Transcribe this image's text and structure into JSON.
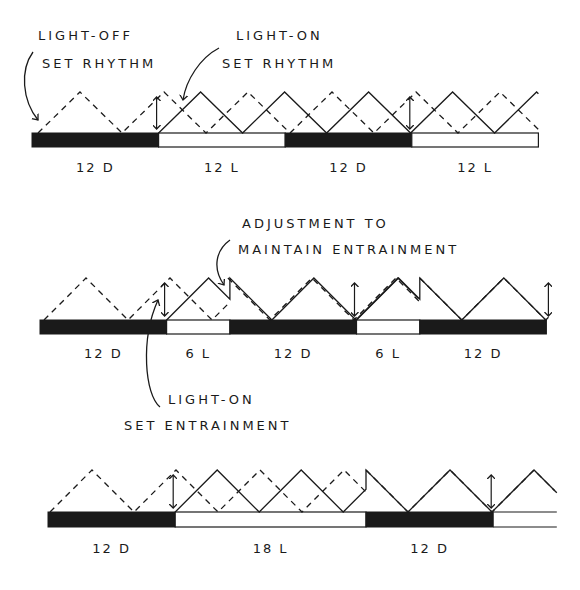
{
  "colors": {
    "ink": "#1a1a1a",
    "dark_phase": "#1a1a1a",
    "light_phase": "#ffffff",
    "background": "#ffffff"
  },
  "panels": [
    {
      "id": "panel-1",
      "schedule": [
        {
          "phase": "D",
          "hours": 12,
          "label": "12 D"
        },
        {
          "phase": "L",
          "hours": 12,
          "label": "12 L"
        },
        {
          "phase": "D",
          "hours": 12,
          "label": "12 D"
        },
        {
          "phase": "L",
          "hours": 12,
          "label": "12 L"
        }
      ],
      "annotations": [
        {
          "lines": [
            "LIGHT-OFF",
            "SET RHYTHM"
          ],
          "target": "free-running dashed rhythm at start of dark"
        },
        {
          "lines": [
            "LIGHT-ON",
            "SET RHYTHM"
          ],
          "target": "solid rhythm starting at light-on"
        }
      ]
    },
    {
      "id": "panel-2",
      "schedule": [
        {
          "phase": "D",
          "hours": 12,
          "label": "12 D"
        },
        {
          "phase": "L",
          "hours": 6,
          "label": "6 L"
        },
        {
          "phase": "D",
          "hours": 12,
          "label": "12 D"
        },
        {
          "phase": "L",
          "hours": 6,
          "label": "6 L"
        },
        {
          "phase": "D",
          "hours": 12,
          "label": "12 D"
        }
      ],
      "annotations": [
        {
          "lines": [
            "ADJUSTMENT TO",
            "MAINTAIN ENTRAINMENT"
          ],
          "target": "reset of solid rhythm at light-off"
        },
        {
          "lines": [
            "LIGHT-ON",
            "SET ENTRAINMENT"
          ],
          "target": "solid rhythm starting at light-on"
        }
      ]
    },
    {
      "id": "panel-3",
      "schedule": [
        {
          "phase": "D",
          "hours": 12,
          "label": "12 D"
        },
        {
          "phase": "L",
          "hours": 18,
          "label": "18 L"
        },
        {
          "phase": "D",
          "hours": 12,
          "label": "12 D"
        },
        {
          "phase": "L",
          "hours": 6,
          "label": ""
        }
      ],
      "annotations": []
    }
  ]
}
